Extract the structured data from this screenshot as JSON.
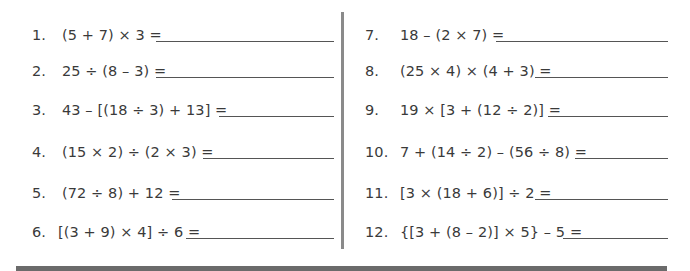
{
  "worksheet": {
    "left_problems": [
      {
        "number": "1.",
        "expression": "(5 + 7) × 3 ="
      },
      {
        "number": "2.",
        "expression": "25 ÷ (8 – 3) ="
      },
      {
        "number": "3.",
        "expression": "43 – [(18 ÷ 3) + 13] ="
      },
      {
        "number": "4.",
        "expression": "(15 × 2) ÷ (2 × 3) ="
      },
      {
        "number": "5.",
        "expression": "(72 ÷ 8) + 12 ="
      },
      {
        "number": "6.",
        "expression": "[(3 + 9) × 4] ÷ 6 ="
      }
    ],
    "right_problems": [
      {
        "number": "7.",
        "expression": "18 – (2 × 7) ="
      },
      {
        "number": "8.",
        "expression": "(25 × 4) × (4 + 3) ="
      },
      {
        "number": "9.",
        "expression": "19 × [3 + (12 ÷ 2)] ="
      },
      {
        "number": "10.",
        "expression": "7 + (14 ÷ 2) – (56 ÷ 8) ="
      },
      {
        "number": "11.",
        "expression": "[3 × (18 + 6)] ÷ 2 ="
      },
      {
        "number": "12.",
        "expression": "{[3 + (8 – 2)] × 5} – 5 ="
      }
    ],
    "answers": [
      "",
      "",
      "",
      "",
      "",
      "",
      "",
      "",
      "",
      "",
      "",
      ""
    ]
  }
}
